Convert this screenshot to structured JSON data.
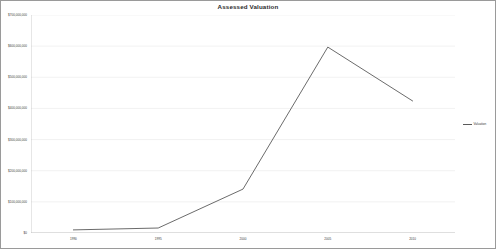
{
  "chart_data": {
    "type": "line",
    "title": "Assessed Valuation",
    "xlabel": "",
    "ylabel": "",
    "categories": [
      "1990",
      "1995",
      "2000",
      "2005",
      "2010"
    ],
    "x": [
      "1990",
      "1995",
      "2000",
      "2005",
      "2010"
    ],
    "series": [
      {
        "name": "Valuation",
        "values": [
          10000000,
          16000000,
          141000000,
          597000000,
          424000000
        ],
        "color": "#5a5a5a"
      }
    ],
    "values": [
      10000000,
      16000000,
      141000000,
      597000000,
      424000000
    ],
    "ylim": [
      0,
      700000000
    ],
    "y_ticks": [
      0,
      100000000,
      200000000,
      300000000,
      400000000,
      500000000,
      600000000,
      700000000
    ],
    "y_tick_labels": [
      "$700,000,000",
      "$600,000,000",
      "$500,000,000",
      "$400,000,000",
      "$300,000,000",
      "$200,000,000",
      "$100,000,000",
      "$0"
    ],
    "x_tick_labels": [
      "1990",
      "1995",
      "2000",
      "2005",
      "2010"
    ],
    "grid": true,
    "grid_axis": "y",
    "grid_color": "#e4e4e4",
    "legend": {
      "position": "right",
      "entries": [
        "Valuation"
      ]
    },
    "plot_border": true,
    "background_color": "#ffffff",
    "frame_border_color": "#9a9a9a"
  },
  "legend": {
    "label": "Valuation"
  }
}
